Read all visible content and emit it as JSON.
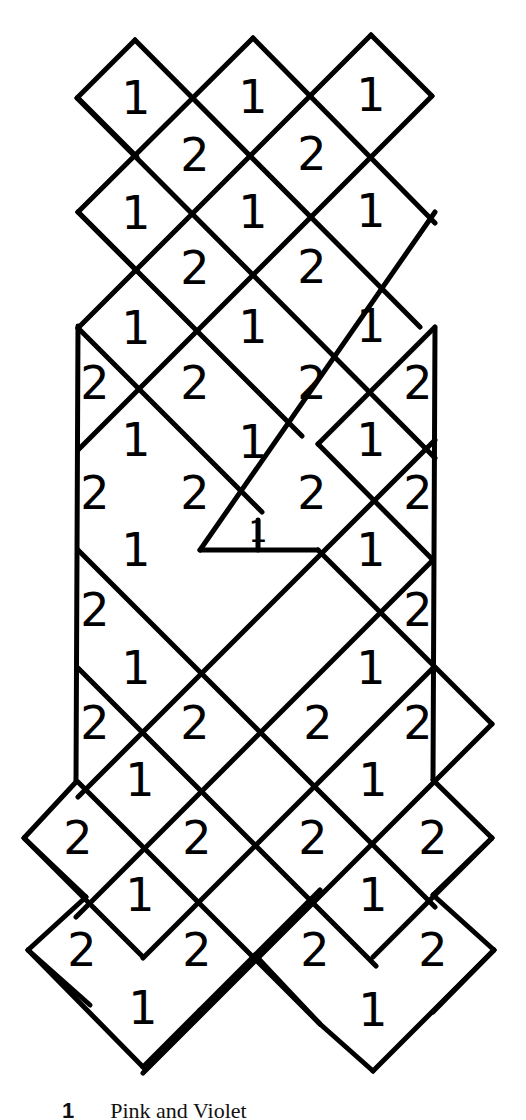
{
  "diagram": {
    "type": "diamond-grid-pattern",
    "stroke_color": "#000000",
    "background": "#ffffff",
    "labels": {
      "one": "1",
      "two": "2"
    },
    "cells": [
      {
        "x": 136,
        "y": 98,
        "label": "1"
      },
      {
        "x": 253,
        "y": 97,
        "label": "1"
      },
      {
        "x": 371,
        "y": 95,
        "label": "1"
      },
      {
        "x": 195,
        "y": 155,
        "label": "2"
      },
      {
        "x": 312,
        "y": 154,
        "label": "2"
      },
      {
        "x": 136,
        "y": 213,
        "label": "1"
      },
      {
        "x": 253,
        "y": 212,
        "label": "1"
      },
      {
        "x": 371,
        "y": 211,
        "label": "1"
      },
      {
        "x": 195,
        "y": 268,
        "label": "2"
      },
      {
        "x": 312,
        "y": 267,
        "label": "2"
      },
      {
        "x": 136,
        "y": 328,
        "label": "1"
      },
      {
        "x": 253,
        "y": 327,
        "label": "1"
      },
      {
        "x": 371,
        "y": 326,
        "label": "1"
      },
      {
        "x": 95,
        "y": 383,
        "label": "2"
      },
      {
        "x": 195,
        "y": 383,
        "label": "2"
      },
      {
        "x": 312,
        "y": 383,
        "label": "2"
      },
      {
        "x": 418,
        "y": 383,
        "label": "2"
      },
      {
        "x": 136,
        "y": 440,
        "label": "1"
      },
      {
        "x": 253,
        "y": 442,
        "label": "1"
      },
      {
        "x": 371,
        "y": 440,
        "label": "1"
      },
      {
        "x": 95,
        "y": 493,
        "label": "2"
      },
      {
        "x": 195,
        "y": 493,
        "label": "2"
      },
      {
        "x": 312,
        "y": 493,
        "label": "2"
      },
      {
        "x": 418,
        "y": 493,
        "label": "2"
      },
      {
        "x": 258,
        "y": 532,
        "label": "1",
        "small": true
      },
      {
        "x": 136,
        "y": 550,
        "label": "1"
      },
      {
        "x": 371,
        "y": 550,
        "label": "1"
      },
      {
        "x": 95,
        "y": 610,
        "label": "2"
      },
      {
        "x": 418,
        "y": 610,
        "label": "2"
      },
      {
        "x": 136,
        "y": 668,
        "label": "1"
      },
      {
        "x": 371,
        "y": 668,
        "label": "1"
      },
      {
        "x": 95,
        "y": 723,
        "label": "2"
      },
      {
        "x": 195,
        "y": 723,
        "label": "2"
      },
      {
        "x": 318,
        "y": 723,
        "label": "2"
      },
      {
        "x": 418,
        "y": 723,
        "label": "2"
      },
      {
        "x": 140,
        "y": 780,
        "label": "1"
      },
      {
        "x": 373,
        "y": 780,
        "label": "1"
      },
      {
        "x": 78,
        "y": 838,
        "label": "2"
      },
      {
        "x": 197,
        "y": 838,
        "label": "2"
      },
      {
        "x": 313,
        "y": 838,
        "label": "2"
      },
      {
        "x": 433,
        "y": 838,
        "label": "2"
      },
      {
        "x": 140,
        "y": 895,
        "label": "1"
      },
      {
        "x": 373,
        "y": 895,
        "label": "1"
      },
      {
        "x": 82,
        "y": 950,
        "label": "2"
      },
      {
        "x": 197,
        "y": 950,
        "label": "2"
      },
      {
        "x": 315,
        "y": 950,
        "label": "2"
      },
      {
        "x": 433,
        "y": 950,
        "label": "2"
      },
      {
        "x": 143,
        "y": 1008,
        "label": "1"
      },
      {
        "x": 373,
        "y": 1010,
        "label": "1"
      }
    ]
  },
  "caption": {
    "number": "1",
    "text": "Pink and Violet"
  }
}
